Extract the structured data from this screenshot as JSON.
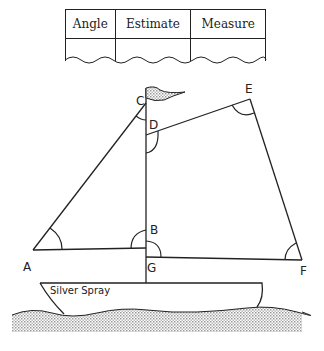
{
  "table": {
    "headers": [
      "Angle",
      "Estimate",
      "Measure"
    ],
    "rows": [
      [
        "",
        "",
        ""
      ]
    ]
  },
  "diagram": {
    "points": {
      "A": {
        "label": "A"
      },
      "B": {
        "label": "B"
      },
      "C": {
        "label": "C"
      },
      "D": {
        "label": "D"
      },
      "E": {
        "label": "E"
      },
      "F": {
        "label": "F"
      },
      "G": {
        "label": "G"
      }
    },
    "boat_name": "Silver Spray",
    "marked_angles": [
      "angle-A",
      "angle-C",
      "angle-D",
      "angle-E",
      "angle-F",
      "angle-B",
      "angle-G"
    ]
  }
}
